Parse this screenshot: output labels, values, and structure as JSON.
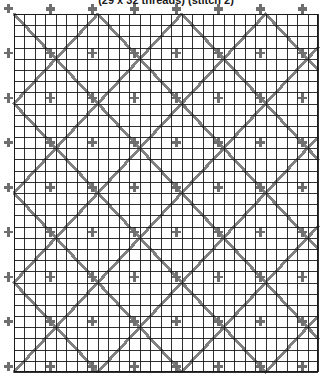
{
  "title": "(29 x 32 threads) (stitch 2)",
  "chart_data": {
    "type": "table",
    "title": "(29 x 32 threads) (stitch 2)",
    "subtitle": "",
    "xlabel": "",
    "ylabel": "",
    "kind": "cross-stitch-pattern-chart",
    "columns": 29,
    "rows": 32,
    "thread_count_label": "29 x 32 threads",
    "stitch_label": "stitch 2",
    "grid": true,
    "legend": "none",
    "cell_width_px": 10.48,
    "cell_height_px": 11.19,
    "motif_repeat": 8,
    "colors": {
      "background": "#ffffff",
      "grid_line": "#1a1a1a",
      "stitch_diagonal": "#808080",
      "stitch_cross": "#6e6e6e",
      "title_text": "#1a1a1a"
    },
    "symbols": [
      {
        "name": "diagonal-stitch",
        "glyph": "/",
        "color": "#808080"
      },
      {
        "name": "back-diagonal-stitch",
        "glyph": "\\",
        "color": "#808080"
      },
      {
        "name": "upright-cross-stitch",
        "glyph": "+",
        "color": "#6e6e6e"
      }
    ],
    "axis_ranges": {
      "x": [
        0,
        29
      ],
      "y": [
        0,
        32
      ]
    },
    "values": [
      29,
      32,
      2
    ]
  }
}
